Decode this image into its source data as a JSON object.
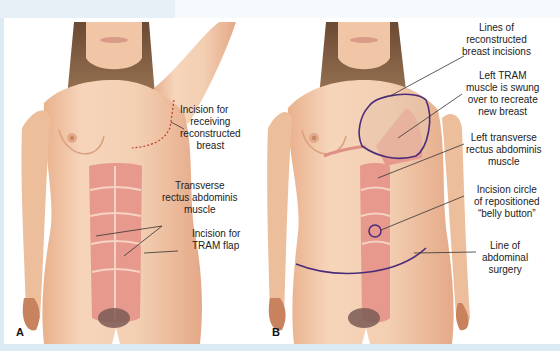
{
  "figure": {
    "cropped_caption": "· · ·",
    "panels": [
      {
        "id": "A",
        "letter": "A",
        "labels": [
          {
            "key": "incision_receiving",
            "lines": [
              "Incision for",
              "receiving",
              "reconstructed",
              "breast"
            ]
          },
          {
            "key": "tram_muscle",
            "lines": [
              "Transverse",
              "rectus abdominis",
              "muscle"
            ]
          },
          {
            "key": "incision_tram_flap",
            "lines": [
              "Incision for",
              "TRAM flap"
            ]
          }
        ]
      },
      {
        "id": "B",
        "letter": "B",
        "labels": [
          {
            "key": "lines_reconstructed",
            "lines": [
              "Lines of",
              "reconstructed",
              "breast incisions"
            ]
          },
          {
            "key": "left_tram_swung",
            "lines": [
              "Left TRAM",
              "muscle is swung",
              "over to recreate",
              "new breast"
            ]
          },
          {
            "key": "left_transverse",
            "lines": [
              "Left transverse",
              "rectus abdominis",
              "muscle"
            ]
          },
          {
            "key": "incision_circle",
            "lines": [
              "Incision circle",
              "of repositioned",
              "“belly button”"
            ]
          },
          {
            "key": "line_abdominal",
            "lines": [
              "Line of",
              "abdominal",
              "surgery"
            ]
          }
        ]
      }
    ]
  },
  "colors": {
    "border_blue": "#dbeaf3",
    "skin": "#f2c9a8",
    "skin_shadow": "#e2a682",
    "muscle": "#e49487",
    "incision_red": "#c0392b",
    "outline_purple": "#4a2c7a",
    "leader_line": "#333333"
  }
}
